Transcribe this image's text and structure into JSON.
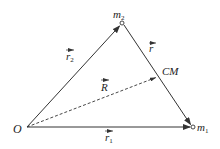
{
  "diagram": {
    "colors": {
      "line": "#333333",
      "text": "#222222",
      "background": "#ffffff"
    },
    "points": {
      "origin": {
        "label": "O",
        "x": 27,
        "y": 127
      },
      "m1": {
        "label": "m",
        "subscript": "1",
        "x": 193,
        "y": 127
      },
      "m2": {
        "label": "m",
        "subscript": "2",
        "x": 122,
        "y": 23
      },
      "cm": {
        "label": "CM",
        "x": 158,
        "y": 77
      }
    },
    "vectors": {
      "r1": {
        "label": "r",
        "subscript": "1",
        "from": "O",
        "to": "m1",
        "style": "solid"
      },
      "r2": {
        "label": "r",
        "subscript": "2",
        "from": "O",
        "to": "m2",
        "style": "solid"
      },
      "r": {
        "label": "r",
        "subscript": "",
        "from": "m2",
        "to": "m1",
        "style": "solid"
      },
      "R": {
        "label": "R",
        "subscript": "",
        "from": "O",
        "to": "CM",
        "style": "dashed"
      }
    }
  }
}
